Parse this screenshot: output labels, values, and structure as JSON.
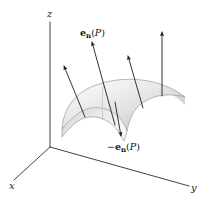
{
  "figure": {
    "background_color": "#ffffff",
    "axes": {
      "x": {
        "label": "x",
        "label_x": 12,
        "label_y": 186
      },
      "y": {
        "label": "y",
        "label_x": 190,
        "label_y": 190
      },
      "z": {
        "label": "z",
        "label_x": 47,
        "label_y": 17
      }
    },
    "labels": [
      {
        "name": "normal-vector-label",
        "prefix": "",
        "symbol": "e",
        "subscript": "n",
        "argument_open": "(",
        "point": "P",
        "argument_close": ")",
        "text": "e_n(P)",
        "x": 80,
        "y": 36
      },
      {
        "name": "negative-normal-vector-label",
        "prefix": "−",
        "symbol": "e",
        "subscript": "n",
        "argument_open": "(",
        "point": "P",
        "argument_close": ")",
        "text": "-e_n(P)",
        "x": 107,
        "y": 150
      }
    ],
    "arrow_count": 4,
    "arrows": [
      {
        "name": "normal-arrow-left",
        "direction": "up"
      },
      {
        "name": "normal-arrow-center",
        "direction": "up"
      },
      {
        "name": "normal-arrow-mid",
        "direction": "up"
      },
      {
        "name": "normal-arrow-right",
        "direction": "up"
      },
      {
        "name": "negative-normal-arrow-center",
        "direction": "down"
      }
    ],
    "surface": {
      "name": "saddle-surface",
      "shape": "saddle",
      "fill_light": "#fbfbfb",
      "fill_mid": "#e3e3e3",
      "fill_dark": "#c9c9c9",
      "edge_color": "#9a9a9a"
    },
    "colors": {
      "axis": "#2b2b2b",
      "arrow": "#1d1d1d",
      "text": "#121212"
    }
  }
}
